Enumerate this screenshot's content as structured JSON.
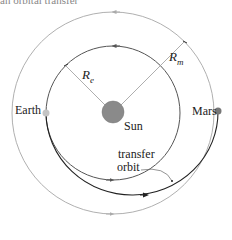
{
  "figure": {
    "top_caption_fragment": "an orbital transfer",
    "labels": {
      "earth": "Earth",
      "mars": "Mars",
      "sun": "Sun",
      "r_earth_main": "R",
      "r_earth_sub": "e",
      "r_mars_main": "R",
      "r_mars_sub": "m",
      "transfer_line1": "transfer",
      "transfer_line2": "orbit"
    },
    "colors": {
      "earth_orbit": "#555555",
      "mars_orbit": "#aaaaaa",
      "transfer_orbit": "#222222",
      "sun_fill": "#888888",
      "earth_dot": "#bbbbbb",
      "mars_dot": "#777777",
      "radius_line": "#aaaaaa"
    }
  }
}
